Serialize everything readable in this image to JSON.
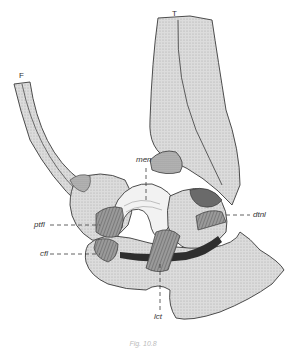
{
  "figure": {
    "bone_labels": {
      "fibula": "F",
      "tibia": "T"
    },
    "structure_labels": {
      "men": "men",
      "ptfl": "ptfl",
      "cfl": "cfl",
      "dtnl": "dtnl",
      "lct": "lct"
    },
    "caption": "Fig. 10.8",
    "colors": {
      "line": "#3a3a3a",
      "bone_fill": "#d4d4d4",
      "ligament_fill": "#8a8a8a",
      "cartilage_fill": "#f2f2f2",
      "background": "#ffffff"
    }
  }
}
